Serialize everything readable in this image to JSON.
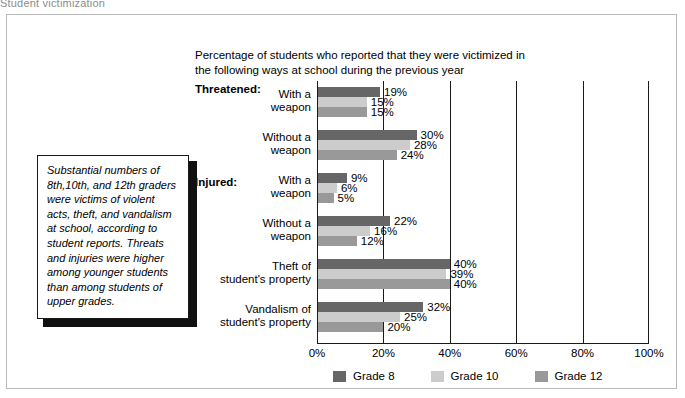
{
  "page": {
    "heading": "Student victimization"
  },
  "chart_title": {
    "line1": "Percentage of students who reported that they were victimized in",
    "line2": "the following ways at school during the previous year"
  },
  "sections": {
    "threatened": "Threatened:",
    "injured": "Injured:"
  },
  "callout": {
    "text": "Substantial numbers of 8th,10th, and 12th graders were victims of violent acts, theft, and vandalism at school, according to student reports. Threats and injuries were higher among younger students than among students of upper grades."
  },
  "legend": {
    "items": [
      {
        "label": "Grade 8",
        "color": "#666666"
      },
      {
        "label": "Grade 10",
        "color": "#cccccc"
      },
      {
        "label": "Grade 12",
        "color": "#999999"
      }
    ]
  },
  "chart_data": {
    "type": "bar",
    "orientation": "horizontal",
    "title": "Percentage of students who reported that they were victimized in the following ways at school during the previous year",
    "xlabel": "",
    "ylabel": "",
    "xlim": [
      0,
      100
    ],
    "xticks": [
      "0%",
      "20%",
      "40%",
      "60%",
      "80%",
      "100%"
    ],
    "xtick_values": [
      0,
      20,
      40,
      60,
      80,
      100
    ],
    "grid": true,
    "legend_position": "bottom",
    "categories": [
      {
        "label_line1": "With a",
        "label_line2": "weapon",
        "section": "Threatened:"
      },
      {
        "label_line1": "Without a",
        "label_line2": "weapon",
        "section": "Threatened:"
      },
      {
        "label_line1": "With a",
        "label_line2": "weapon",
        "section": "Injured:"
      },
      {
        "label_line1": "Without a",
        "label_line2": "weapon",
        "section": "Injured:"
      },
      {
        "label_line1": "Theft of",
        "label_line2": "student's property",
        "section": ""
      },
      {
        "label_line1": "Vandalism of",
        "label_line2": "student's property",
        "section": ""
      }
    ],
    "series": [
      {
        "name": "Grade 8",
        "color": "#666666",
        "values": [
          19,
          30,
          9,
          22,
          40,
          32
        ],
        "labels": [
          "19%",
          "30%",
          "9%",
          "22%",
          "40%",
          "32%"
        ]
      },
      {
        "name": "Grade 10",
        "color": "#cccccc",
        "values": [
          15,
          28,
          6,
          16,
          39,
          25
        ],
        "labels": [
          "15%",
          "28%",
          "6%",
          "16%",
          "39%",
          "25%"
        ]
      },
      {
        "name": "Grade 12",
        "color": "#999999",
        "values": [
          15,
          24,
          5,
          12,
          40,
          20
        ],
        "labels": [
          "15%",
          "24%",
          "5%",
          "12%",
          "40%",
          "20%"
        ]
      }
    ]
  }
}
